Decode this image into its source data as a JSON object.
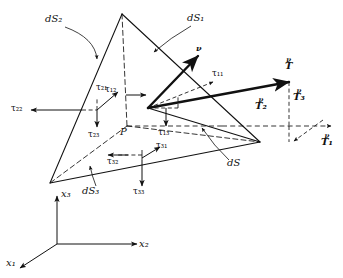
{
  "figure": {
    "kind": "cauchy-tetrahedron-stress-diagram"
  },
  "colors": {
    "ink": "#111111",
    "paper": "#ffffff"
  },
  "axes": {
    "x1": "x₁",
    "x2": "x₂",
    "x3": "x₃"
  },
  "point_label": "P",
  "faces": {
    "oblique": "dS",
    "face1": "dS₁",
    "face2": "dS₂",
    "face3": "dS₃"
  },
  "normal_label": "ν",
  "traction": {
    "resultant": "T",
    "superscript": "ν",
    "component1": "T₁",
    "component2": "T₂",
    "component3": "T₃"
  },
  "stresses": {
    "t11": "τ₁₁",
    "t12": "τ₁₂",
    "t13": "τ₁₃",
    "t21": "τ₂₁",
    "t22": "τ₂₂",
    "t23": "τ₂₃",
    "t31": "τ₃₁",
    "t32": "τ₃₂",
    "t33": "τ₃₃"
  }
}
